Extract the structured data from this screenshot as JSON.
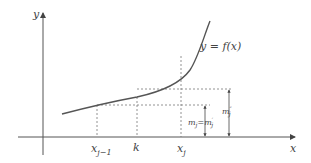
{
  "diagram": {
    "title": "",
    "axes": {
      "x_label": "x",
      "y_label": "y"
    },
    "curve": {
      "label": "y = f(x)"
    },
    "x_ticks": [
      {
        "label": "x",
        "sub": "j−1"
      },
      {
        "label": "k",
        "sub": ""
      },
      {
        "label": "x",
        "sub": "j"
      }
    ],
    "heights": [
      {
        "label": "m",
        "sub": "j",
        "eq": "=",
        "label2": "m",
        "sup2": "′",
        "sub2": "j"
      },
      {
        "label": "m",
        "sup": "″",
        "sub": "j"
      }
    ],
    "colors": {
      "axis": "#555555",
      "curve": "#555555",
      "dotted": "#777777",
      "text": "#444444"
    }
  }
}
